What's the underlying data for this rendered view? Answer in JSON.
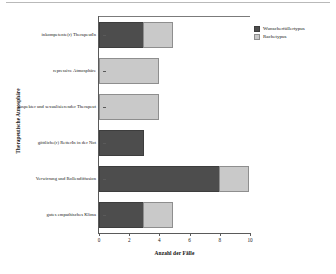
{
  "chart_data": {
    "type": "bar",
    "orientation": "horizontal",
    "stacked": true,
    "title": "",
    "xlabel": "Anzahl der Fälle",
    "ylabel": "Therapeutische Atmosphäre",
    "xlim": [
      0,
      10
    ],
    "xticks": [
      0,
      2,
      4,
      6,
      8,
      10
    ],
    "xtick_labels": [
      "0",
      "2",
      "4",
      "6",
      "8",
      "10"
    ],
    "grid": false,
    "legend_position": "top-right",
    "categories": [
      "inkompetente(r) TherapeutIn",
      "repressive Atmosphäre",
      "suspekter und sexualisierender Therapeut",
      "göttliche(r) RetterIn in der Not",
      "Verwirrung und Rollendiffusion",
      "gutes empathisches Klima"
    ],
    "series": [
      {
        "name": "Wunscherfüllertypus",
        "color": "#4d4d4d",
        "values": [
          3,
          0,
          0,
          3,
          8,
          3
        ]
      },
      {
        "name": "Rachetypus",
        "color": "#c9c9c9",
        "values": [
          2,
          4,
          4,
          0,
          2,
          2
        ]
      }
    ],
    "totals": [
      5,
      4,
      4,
      3,
      10,
      5
    ]
  },
  "legend": {
    "entries": [
      {
        "label": "Wunscherfüllertypus",
        "swatch": "dark"
      },
      {
        "label": "Rachetypus",
        "swatch": "light"
      }
    ]
  }
}
